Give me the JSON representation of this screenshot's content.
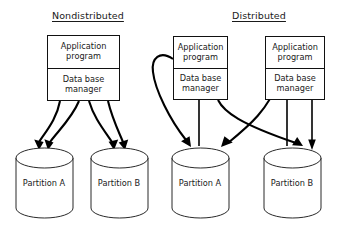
{
  "diagram": {
    "title_left": "Nondistributed",
    "title_right": "Distributed",
    "node_labels": {
      "application_line1": "Application",
      "application_line2": "program",
      "database_line1": "Data base",
      "database_line2": "manager"
    },
    "nondistributed": {
      "heading": "Nondistributed",
      "node": {
        "application_line1": "Application",
        "application_line2": "program",
        "database_line1": "Data base",
        "database_line2": "manager"
      },
      "partitions": [
        {
          "line1": "Partition",
          "line2": "A"
        },
        {
          "line1": "Partition",
          "line2": "B"
        }
      ]
    },
    "distributed": {
      "heading": "Distributed",
      "nodes": [
        {
          "application_line1": "Application",
          "application_line2": "program",
          "database_line1": "Data base",
          "database_line2": "manager"
        },
        {
          "application_line1": "Application",
          "application_line2": "program",
          "database_line1": "Data base",
          "database_line2": "manager"
        }
      ],
      "partitions": [
        {
          "line1": "Partition",
          "line2": "A"
        },
        {
          "line1": "Partition",
          "line2": "B"
        }
      ]
    },
    "colors": {
      "stroke": "#111111",
      "text": "#1a1a1a",
      "background": "#ffffff"
    }
  }
}
